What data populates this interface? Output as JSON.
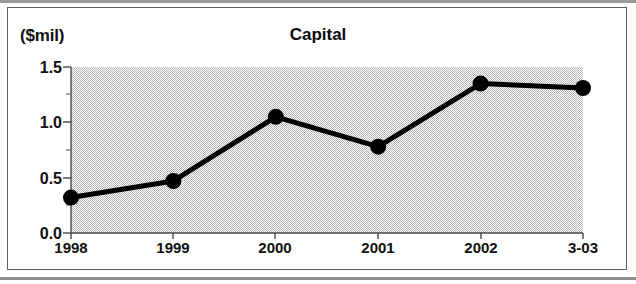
{
  "chart_data": {
    "type": "line",
    "title": "Capital",
    "ylabel": "($mil)",
    "xlabel": "",
    "categories": [
      "1998",
      "1999",
      "2000",
      "2001",
      "2002",
      "3-03"
    ],
    "values": [
      0.32,
      0.47,
      1.05,
      0.78,
      1.35,
      1.31
    ],
    "series": [
      {
        "name": "Capital",
        "values": [
          0.32,
          0.47,
          1.05,
          0.78,
          1.35,
          1.31
        ]
      }
    ],
    "ylim": [
      0.0,
      1.5
    ],
    "ytick_labels": [
      "0.0",
      "0.5",
      "1.0",
      "1.5"
    ],
    "ytick_values": [
      0.0,
      0.5,
      1.0,
      1.5
    ],
    "yminor_tick_values": [
      0.25,
      0.75,
      1.25
    ],
    "grid": false,
    "legend": false,
    "legend_position": "none",
    "marker": "filled-circle",
    "line_color": "#000000",
    "marker_color": "#000000",
    "plot_background_color": "#d9d9d9",
    "axis_color": "#4a4a4a"
  },
  "figure": {
    "frame_color": "#606060",
    "page_background": "#ffffff"
  }
}
